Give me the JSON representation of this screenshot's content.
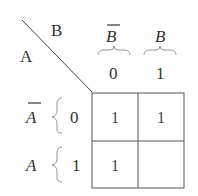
{
  "kmap": {
    "corner_col_var": "B",
    "corner_row_var": "A",
    "columns": [
      {
        "label": "B",
        "negated": true,
        "code": "0"
      },
      {
        "label": "B",
        "negated": false,
        "code": "1"
      }
    ],
    "rows": [
      {
        "label": "A",
        "negated": true,
        "code": "0"
      },
      {
        "label": "A",
        "negated": false,
        "code": "1"
      }
    ],
    "cells": [
      [
        "1",
        "1"
      ],
      [
        "1",
        ""
      ]
    ]
  }
}
